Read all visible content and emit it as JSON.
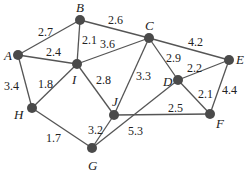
{
  "graph": {
    "nodes": [
      {
        "id": "A",
        "x": 18,
        "y": 55,
        "lx": 4,
        "ly": 60
      },
      {
        "id": "B",
        "x": 80,
        "y": 20,
        "lx": 76,
        "ly": 12
      },
      {
        "id": "C",
        "x": 149,
        "y": 38,
        "lx": 145,
        "ly": 30
      },
      {
        "id": "I",
        "x": 77,
        "y": 64,
        "lx": 72,
        "ly": 84
      },
      {
        "id": "E",
        "x": 229,
        "y": 60,
        "lx": 236,
        "ly": 64
      },
      {
        "id": "D",
        "x": 178,
        "y": 80,
        "lx": 163,
        "ly": 86
      },
      {
        "id": "H",
        "x": 32,
        "y": 108,
        "lx": 14,
        "ly": 119
      },
      {
        "id": "J",
        "x": 114,
        "y": 115,
        "lx": 112,
        "ly": 106
      },
      {
        "id": "F",
        "x": 210,
        "y": 114,
        "lx": 216,
        "ly": 128
      },
      {
        "id": "G",
        "x": 92,
        "y": 148,
        "lx": 88,
        "ly": 170
      }
    ],
    "edges": [
      {
        "from": "A",
        "to": "B",
        "weight": "2.7",
        "lx": 38,
        "ly": 36
      },
      {
        "from": "B",
        "to": "C",
        "weight": "2.6",
        "lx": 108,
        "ly": 24
      },
      {
        "from": "B",
        "to": "I",
        "weight": "2.1",
        "lx": 82,
        "ly": 44
      },
      {
        "from": "A",
        "to": "I",
        "weight": "2.4",
        "lx": 46,
        "ly": 56
      },
      {
        "from": "I",
        "to": "C",
        "weight": "3.6",
        "lx": 100,
        "ly": 48
      },
      {
        "from": "C",
        "to": "E",
        "weight": "4.2",
        "lx": 188,
        "ly": 46
      },
      {
        "from": "C",
        "to": "D",
        "weight": "2.9",
        "lx": 166,
        "ly": 62
      },
      {
        "from": "C",
        "to": "J",
        "weight": "3.3",
        "lx": 136,
        "ly": 80
      },
      {
        "from": "D",
        "to": "E",
        "weight": "2.2",
        "lx": 187,
        "ly": 72
      },
      {
        "from": "D",
        "to": "F",
        "weight": "2.1",
        "lx": 198,
        "ly": 98
      },
      {
        "from": "E",
        "to": "F",
        "weight": "4.4",
        "lx": 222,
        "ly": 94
      },
      {
        "from": "A",
        "to": "H",
        "weight": "3.4",
        "lx": 4,
        "ly": 90
      },
      {
        "from": "I",
        "to": "H",
        "weight": "1.8",
        "lx": 38,
        "ly": 88
      },
      {
        "from": "I",
        "to": "J",
        "weight": "2.8",
        "lx": 96,
        "ly": 84
      },
      {
        "from": "J",
        "to": "F",
        "weight": "2.5",
        "lx": 168,
        "ly": 112
      },
      {
        "from": "J",
        "to": "G",
        "weight": "3.2",
        "lx": 88,
        "ly": 134
      },
      {
        "from": "G",
        "to": "D",
        "weight": "5.3",
        "lx": 128,
        "ly": 135
      },
      {
        "from": "H",
        "to": "G",
        "weight": "1.7",
        "lx": 46,
        "ly": 142
      }
    ]
  }
}
